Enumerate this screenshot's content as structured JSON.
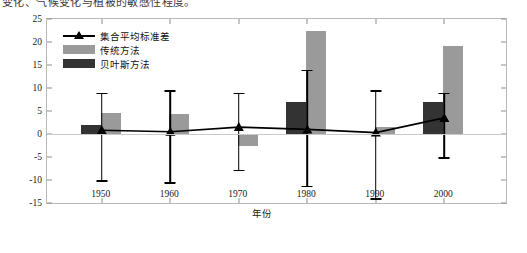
{
  "caption": {
    "text": "变化、气候变化与植被的敏感性程度。"
  },
  "chart_data": {
    "type": "bar",
    "title": "",
    "xlabel": "年份",
    "ylabel": "格陆地NEP (TgC/a)",
    "categories": [
      "1950",
      "1960",
      "1970",
      "1980",
      "1990",
      "2000"
    ],
    "x": [
      1950,
      1960,
      1970,
      1980,
      1990,
      2000
    ],
    "xlim": [
      1942,
      2009
    ],
    "ylim": [
      -15,
      25
    ],
    "yticks": [
      25,
      20,
      15,
      10,
      5,
      0,
      -5,
      -10,
      -15
    ],
    "grid": false,
    "legend_position": "top-left",
    "series": [
      {
        "name": "集合平均标准差",
        "type": "line",
        "marker": "triangle",
        "color": "#000000",
        "values": [
          0.8,
          0.5,
          1.5,
          1.0,
          0.3,
          3.5
        ],
        "error_low": [
          -10.0,
          -10.5,
          -7.8,
          -11.2,
          -14.0,
          -5.0
        ],
        "error_high": [
          9.0,
          9.5,
          9.0,
          14.0,
          9.5,
          9.0
        ]
      },
      {
        "name": "传统方法",
        "type": "bar",
        "color": "#9a9a9a",
        "values": [
          4.5,
          4.3,
          -2.5,
          22.5,
          1.5,
          19.2
        ]
      },
      {
        "name": "贝叶斯方法",
        "type": "bar",
        "color": "#333333",
        "values": [
          2.0,
          0.0,
          0.0,
          7.0,
          0.0,
          7.0
        ]
      }
    ]
  },
  "legend": {
    "items": [
      {
        "label": "集合平均标准差",
        "key": "line-triangle-key"
      },
      {
        "label": "传统方法",
        "key": "swatch-light-gray"
      },
      {
        "label": "贝叶斯方法",
        "key": "swatch-dark-gray"
      }
    ]
  },
  "colors": {
    "traditional": "#9a9a9a",
    "bayesian": "#333333",
    "line": "#000000",
    "axis": "#b9b9b9",
    "zero_line": "#c9c9c9"
  }
}
